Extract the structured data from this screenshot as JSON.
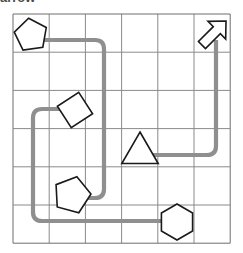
{
  "caption": {
    "text": "arrow",
    "note": "partially clipped text at very top edge of screenshot"
  },
  "colors": {
    "background": "#ffffff",
    "grid_line": "#8a8a8a",
    "grid_border": "#6e6e6e",
    "path": "#8f8f8f",
    "shape_outline": "#1a1a1a",
    "shape_fill": "#ffffff"
  },
  "grid": {
    "label": "6x6 grid",
    "columns": 6,
    "rows": 6,
    "x0": 13,
    "y0": 14,
    "cell_width": 36.2,
    "cell_height": 38.2,
    "line_width": 1
  },
  "path": {
    "label": "connector-path",
    "stroke_width": 4.2,
    "corner_radius": 9,
    "segments": [
      {
        "name": "pentagon-top-to-pentagon-bottom",
        "d": "M 40 40 L 95 40 Q 104 40 104 49 L 104 189 Q 104 198 95 198 L 80 198"
      },
      {
        "name": "diamond-to-hexagon",
        "d": "M 73 109 L 42 109 Q 33 109 33 118 L 33 212 Q 33 221 42 221 L 176 221"
      },
      {
        "name": "triangle-to-arrow",
        "d": "M 146 155 L 207 155 Q 216 155 216 146 L 216 40"
      }
    ]
  },
  "shapes": [
    {
      "name": "pentagon-top-left",
      "type": "pentagon",
      "cell": [
        1,
        1
      ],
      "cx": 31,
      "cy": 35,
      "radius": 17,
      "rotation": -8
    },
    {
      "name": "arrow-top-right",
      "type": "arrow",
      "cell": [
        6,
        1
      ],
      "cx": 214,
      "cy": 33,
      "direction": "up-right",
      "rotation": 45
    },
    {
      "name": "diamond-middle-left",
      "type": "diamond",
      "cell": [
        2,
        3
      ],
      "cx": 75,
      "cy": 110,
      "radius": 18,
      "rotation": 12
    },
    {
      "name": "triangle-middle",
      "type": "triangle",
      "cell": [
        4,
        4
      ],
      "cx": 140,
      "cy": 153,
      "radius": 21,
      "rotation": 0
    },
    {
      "name": "pentagon-lower-left",
      "type": "pentagon",
      "cell": [
        2,
        5
      ],
      "cx": 72,
      "cy": 195,
      "radius": 19,
      "rotation": 15
    },
    {
      "name": "hexagon-bottom",
      "type": "hexagon",
      "cell": [
        5,
        6
      ],
      "cx": 177,
      "cy": 222,
      "radius": 18,
      "rotation": 0
    }
  ]
}
